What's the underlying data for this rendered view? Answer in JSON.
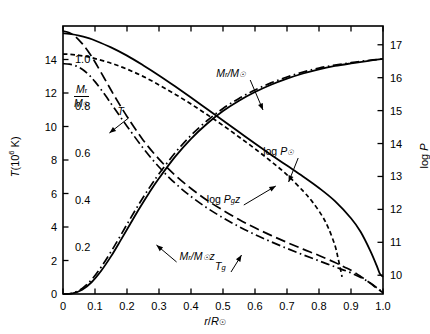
{
  "chart_data": {
    "type": "line",
    "title": "",
    "xlabel": "r/R☉",
    "ylabel_left_primary": "T(10⁶ K)",
    "ylabel_left_secondary": "Mᵣ/M☉",
    "ylabel_right": "log P",
    "xlim": [
      0,
      1.0
    ],
    "ylim_left_T": [
      0,
      16
    ],
    "ylim_left_M": [
      0,
      1.14
    ],
    "ylim_right_logP": [
      9.43,
      17.57
    ],
    "grid": false,
    "legend": "inline-annotations",
    "xticks": [
      "0",
      "0.1",
      "0.2",
      "0.3",
      "0.4",
      "0.5",
      "0.6",
      "0.7",
      "0.8",
      "0.9",
      "1.0"
    ],
    "xtickvals": [
      0,
      0.1,
      0.2,
      0.3,
      0.4,
      0.5,
      0.6,
      0.7,
      0.8,
      0.9,
      1.0
    ],
    "yticks_left_T": [
      "0",
      "2",
      "4",
      "6",
      "8",
      "10",
      "12",
      "14"
    ],
    "ytickvals_left_T": [
      0,
      2,
      4,
      6,
      8,
      10,
      12,
      14
    ],
    "yticks_left_M": [
      "0.2",
      "0.4",
      "0.6",
      "0.8",
      "1.0"
    ],
    "ytickvals_left_M": [
      0.2,
      0.4,
      0.6,
      0.8,
      1.0
    ],
    "yticks_right": [
      "10",
      "11",
      "12",
      "13",
      "14",
      "15",
      "16",
      "17"
    ],
    "ytickvals_right": [
      10,
      11,
      12,
      13,
      14,
      15,
      16,
      17
    ],
    "series": [
      {
        "name": "log P☉",
        "label": "log P☉",
        "style": "solid",
        "axis": "right-logP",
        "x": [
          0.0,
          0.02,
          0.05,
          0.08,
          0.1,
          0.15,
          0.2,
          0.25,
          0.3,
          0.35,
          0.4,
          0.45,
          0.5,
          0.55,
          0.6,
          0.65,
          0.7,
          0.75,
          0.8,
          0.85,
          0.9,
          0.93,
          0.96,
          0.98,
          0.99,
          1.0
        ],
        "values": [
          17.35,
          17.33,
          17.28,
          17.2,
          17.13,
          16.92,
          16.67,
          16.38,
          16.07,
          15.74,
          15.4,
          15.05,
          14.7,
          14.35,
          14.0,
          13.66,
          13.33,
          13.0,
          12.65,
          12.25,
          11.73,
          11.32,
          10.75,
          10.3,
          10.05,
          9.95
        ]
      },
      {
        "name": "log P_g z",
        "label": "log P₉z",
        "style": "dashed-short",
        "axis": "right-logP",
        "x": [
          0.0,
          0.02,
          0.05,
          0.08,
          0.1,
          0.15,
          0.2,
          0.25,
          0.3,
          0.35,
          0.4,
          0.45,
          0.5,
          0.55,
          0.6,
          0.65,
          0.7,
          0.75,
          0.78,
          0.81,
          0.83,
          0.85,
          0.86,
          0.87,
          0.872
        ],
        "values": [
          16.72,
          16.71,
          16.68,
          16.63,
          16.58,
          16.44,
          16.26,
          16.04,
          15.78,
          15.5,
          15.2,
          14.88,
          14.55,
          14.2,
          13.84,
          13.46,
          13.05,
          12.56,
          12.22,
          11.8,
          11.42,
          10.9,
          10.5,
          10.05,
          9.95
        ]
      },
      {
        "name": "M_r/M_sun",
        "label": "Mᵣ/M☉",
        "style": "solid",
        "axis": "left-M",
        "x": [
          0.0,
          0.03,
          0.06,
          0.09,
          0.12,
          0.15,
          0.18,
          0.21,
          0.24,
          0.27,
          0.3,
          0.35,
          0.4,
          0.45,
          0.5,
          0.55,
          0.6,
          0.65,
          0.7,
          0.75,
          0.8,
          0.85,
          0.9,
          0.95,
          1.0
        ],
        "values": [
          0.0,
          0.003,
          0.018,
          0.051,
          0.1,
          0.16,
          0.228,
          0.298,
          0.367,
          0.432,
          0.492,
          0.583,
          0.66,
          0.724,
          0.778,
          0.822,
          0.859,
          0.89,
          0.916,
          0.938,
          0.956,
          0.97,
          0.981,
          0.991,
          1.0
        ]
      },
      {
        "name": "M_r/M_sun z",
        "label": "Mᵣ/M☉z",
        "style": "dashdot",
        "axis": "left-M",
        "x": [
          0.0,
          0.03,
          0.06,
          0.09,
          0.12,
          0.15,
          0.18,
          0.21,
          0.24,
          0.27,
          0.3,
          0.35,
          0.4,
          0.45,
          0.5,
          0.55,
          0.6,
          0.65,
          0.7,
          0.75,
          0.8,
          0.85,
          0.9,
          0.95,
          1.0
        ],
        "values": [
          0.0,
          0.004,
          0.024,
          0.062,
          0.116,
          0.18,
          0.249,
          0.32,
          0.388,
          0.452,
          0.511,
          0.6,
          0.675,
          0.737,
          0.789,
          0.832,
          0.868,
          0.898,
          0.923,
          0.944,
          0.961,
          0.974,
          0.984,
          0.993,
          1.0
        ]
      },
      {
        "name": "T",
        "label": "T",
        "style": "dashed-long",
        "axis": "left-T",
        "x": [
          0.0,
          0.02,
          0.04,
          0.06,
          0.08,
          0.1,
          0.13,
          0.16,
          0.2,
          0.25,
          0.3,
          0.35,
          0.4,
          0.45,
          0.5,
          0.55,
          0.6,
          0.65,
          0.7,
          0.75,
          0.8,
          0.85,
          0.88,
          0.9,
          0.93,
          0.96,
          0.98,
          1.0
        ],
        "values": [
          15.7,
          15.6,
          15.35,
          14.95,
          14.45,
          13.85,
          12.85,
          11.85,
          10.6,
          9.2,
          8.05,
          7.1,
          6.3,
          5.6,
          5.0,
          4.45,
          3.95,
          3.5,
          3.08,
          2.68,
          2.3,
          1.88,
          1.6,
          1.42,
          1.05,
          0.65,
          0.35,
          0.08
        ]
      },
      {
        "name": "T_z",
        "label": "T₉",
        "style": "dashdot",
        "axis": "left-T",
        "x": [
          0.0,
          0.02,
          0.04,
          0.06,
          0.08,
          0.1,
          0.13,
          0.16,
          0.2,
          0.25,
          0.3,
          0.35,
          0.4,
          0.45,
          0.5,
          0.55,
          0.6,
          0.65,
          0.7,
          0.75,
          0.8,
          0.85,
          0.9,
          0.95,
          1.0
        ],
        "values": [
          13.75,
          13.72,
          13.62,
          13.42,
          13.1,
          12.68,
          11.92,
          11.1,
          10.02,
          8.72,
          7.58,
          6.62,
          5.82,
          5.14,
          4.55,
          4.02,
          3.55,
          3.12,
          2.72,
          2.34,
          1.98,
          1.62,
          1.26,
          0.78,
          0.1
        ]
      }
    ],
    "annotations": [
      {
        "text": "T",
        "x": 0.205,
        "y_px": 118,
        "arrow_to_x": 0.145,
        "arrow_to_y_px": 133
      },
      {
        "text": "Mᵣ/M☉",
        "x": 0.585,
        "y_px": 80,
        "arrow_to_x": 0.625,
        "arrow_to_y_px": 110
      },
      {
        "text": "log P☉",
        "x": 0.735,
        "y_px": 158,
        "arrow_to_x": 0.705,
        "arrow_to_y_px": 182
      },
      {
        "text": "log P₉z",
        "x": 0.565,
        "y_px": 205,
        "arrow_to_x": 0.665,
        "arrow_to_y_px": 186
      },
      {
        "text": "Mᵣ/M☉z",
        "x": 0.355,
        "y_px": 262,
        "arrow_to_x": 0.292,
        "arrow_to_y_px": 245
      },
      {
        "text": "T₉",
        "x": 0.525,
        "y_px": 272,
        "arrow_to_x": 0.558,
        "arrow_to_y_px": 255
      }
    ]
  },
  "axes": {
    "x_label": "r/R☉",
    "y_left_label": "T(10⁶ K)",
    "y_left_inner_label_num": "Mᵣ",
    "y_left_inner_label_den": "M☉",
    "y_right_label": "log P"
  },
  "colors": {
    "ink": "#000000",
    "background": "#ffffff"
  }
}
